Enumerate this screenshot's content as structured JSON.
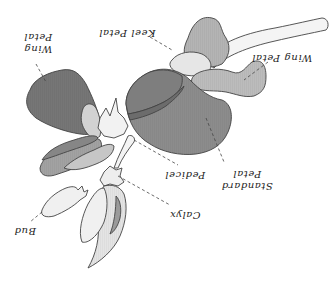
{
  "diagram": {
    "orientation_deg": 180,
    "colors": {
      "dark_petal": "#7a7a7a",
      "standard_petal": "#8a8a8a",
      "mid_petal": "#a8a8a8",
      "light_petal": "#cfcfcf",
      "very_light": "#ececec",
      "outline": "#444444",
      "label": "#222222"
    },
    "labels": {
      "wing_petal_left_line1": "Wing",
      "wing_petal_left_line2": "Petal",
      "keel_petal": "Keel Petal",
      "wing_petal_right": "Wing Petal",
      "standard_petal_line1": "Standard",
      "standard_petal_line2": "Petal",
      "pedicel": "Pedicel",
      "calyx": "Calyx",
      "bud": "Bud"
    }
  }
}
